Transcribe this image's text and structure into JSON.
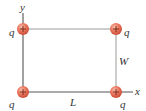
{
  "diagram": {
    "axes": {
      "x_label": "x",
      "y_label": "y"
    },
    "dimensions": {
      "length_label": "L",
      "width_label": "W"
    },
    "charges": [
      {
        "position": "top-left",
        "label": "q",
        "sign": "+"
      },
      {
        "position": "top-right",
        "label": "q",
        "sign": "+"
      },
      {
        "position": "bottom-left",
        "label": "q",
        "sign": "+"
      },
      {
        "position": "bottom-right",
        "label": "q",
        "sign": "+"
      }
    ],
    "colors": {
      "charge_fill": "#e8725a",
      "charge_highlight": "#f6b59f",
      "rectangle": "#9a9a9a",
      "axis": "#555555"
    }
  }
}
